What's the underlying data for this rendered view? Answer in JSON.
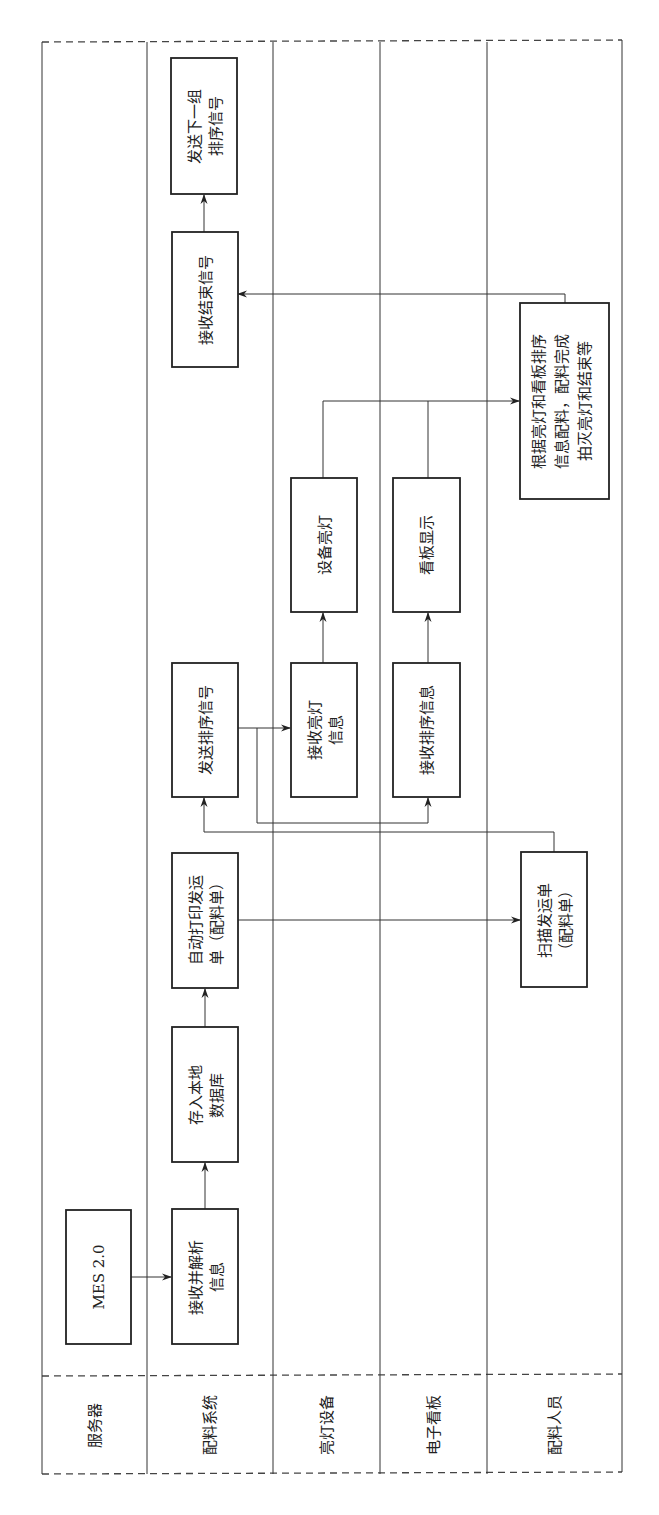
{
  "diagram": {
    "type": "swimlane-flowchart",
    "orientation": "rotated-90-ccw",
    "lanes": [
      {
        "id": "server",
        "label": "服务器"
      },
      {
        "id": "material-system",
        "label": "配料系统"
      },
      {
        "id": "light-device",
        "label": "亮灯设备"
      },
      {
        "id": "e-board",
        "label": "电子看板"
      },
      {
        "id": "operator",
        "label": "配料人员"
      }
    ],
    "nodes": {
      "mes": {
        "lane": "server",
        "lines": [
          "MES 2.0"
        ]
      },
      "receive_parse": {
        "lane": "material-system",
        "lines": [
          "接收并解析",
          "信息"
        ]
      },
      "store_db": {
        "lane": "material-system",
        "lines": [
          "存入本地",
          "数据库"
        ]
      },
      "auto_print": {
        "lane": "material-system",
        "lines": [
          "自动打印发运",
          "单（配料单）"
        ]
      },
      "send_sort": {
        "lane": "material-system",
        "lines": [
          "发送排序信号"
        ]
      },
      "receive_end": {
        "lane": "material-system",
        "lines": [
          "接收结束信号"
        ]
      },
      "send_next": {
        "lane": "material-system",
        "lines": [
          "发送下一组",
          "排序信号"
        ]
      },
      "receive_light": {
        "lane": "light-device",
        "lines": [
          "接收亮灯",
          "信息"
        ]
      },
      "device_light": {
        "lane": "light-device",
        "lines": [
          "设备亮灯"
        ]
      },
      "receive_sort": {
        "lane": "e-board",
        "lines": [
          "接收排序信息"
        ]
      },
      "board_display": {
        "lane": "e-board",
        "lines": [
          "看板显示"
        ]
      },
      "scan_slip": {
        "lane": "operator",
        "lines": [
          "扫描发运单",
          "（配料单）"
        ]
      },
      "pick_by_light": {
        "lane": "operator",
        "lines": [
          "根据亮灯和看板排序",
          "信息配料，配料完成",
          "拍灭亮灯和结束等"
        ]
      }
    },
    "edges": [
      {
        "from": "mes",
        "to": "receive_parse"
      },
      {
        "from": "receive_parse",
        "to": "store_db"
      },
      {
        "from": "store_db",
        "to": "auto_print"
      },
      {
        "from": "auto_print",
        "to": "scan_slip"
      },
      {
        "from": "scan_slip",
        "to": "send_sort"
      },
      {
        "from": "send_sort",
        "to": "receive_light"
      },
      {
        "from": "send_sort",
        "to": "receive_sort"
      },
      {
        "from": "receive_light",
        "to": "device_light"
      },
      {
        "from": "receive_sort",
        "to": "board_display"
      },
      {
        "from": "device_light",
        "to": "pick_by_light"
      },
      {
        "from": "board_display",
        "to": "pick_by_light"
      },
      {
        "from": "pick_by_light",
        "to": "receive_end"
      },
      {
        "from": "receive_end",
        "to": "send_next"
      }
    ]
  }
}
